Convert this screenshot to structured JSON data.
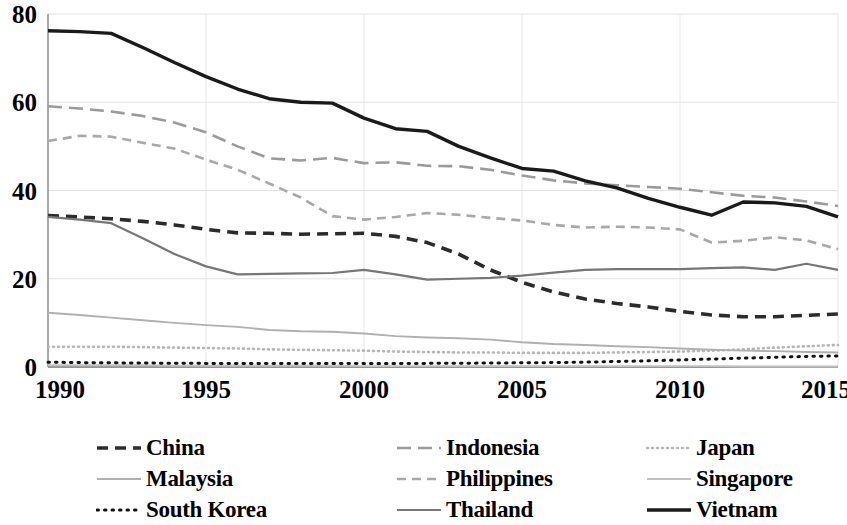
{
  "chart_data": {
    "type": "line",
    "title": "",
    "subtitle": "",
    "xlabel": "",
    "ylabel": "",
    "xlim": [
      1990,
      2015
    ],
    "ylim": [
      0,
      80
    ],
    "grid": true,
    "legend_position": "bottom",
    "y_ticks": [
      "0",
      "20",
      "40",
      "60",
      "80"
    ],
    "y_tick_values": [
      0,
      20,
      40,
      60,
      80
    ],
    "x_ticks": [
      "1990",
      "1995",
      "2000",
      "2005",
      "2010",
      "2015"
    ],
    "x_tick_values": [
      1990,
      1995,
      2000,
      2005,
      2010,
      2015
    ],
    "x": [
      1990,
      1991,
      1992,
      1993,
      1994,
      1995,
      1996,
      1997,
      1998,
      1999,
      2000,
      2001,
      2002,
      2003,
      2004,
      2005,
      2006,
      2007,
      2008,
      2009,
      2010,
      2011,
      2012,
      2013,
      2014,
      2015
    ],
    "series": [
      {
        "name": "China",
        "color": "#2b2b2b",
        "width": 3.6,
        "dash": "11,7",
        "cap": "butt",
        "values": [
          34.3,
          34.0,
          33.6,
          33.0,
          32.2,
          31.2,
          30.4,
          30.3,
          30.1,
          30.2,
          30.3,
          29.6,
          28.2,
          25.6,
          22.0,
          19.2,
          17.0,
          15.4,
          14.4,
          13.6,
          12.6,
          11.8,
          11.4,
          11.4,
          11.7,
          12.0
        ]
      },
      {
        "name": "Indonesia",
        "color": "#9a9a9a",
        "width": 2.6,
        "dash": "14,7",
        "cap": "butt",
        "values": [
          59.1,
          58.6,
          57.9,
          56.9,
          55.4,
          53.2,
          50.0,
          47.3,
          46.8,
          47.4,
          46.2,
          46.4,
          45.6,
          45.5,
          44.7,
          43.4,
          42.3,
          41.6,
          41.2,
          40.8,
          40.4,
          39.6,
          38.8,
          38.4,
          37.5,
          36.5
        ]
      },
      {
        "name": "Japan",
        "color": "#b6b6b6",
        "width": 2.6,
        "dash": "1,4",
        "cap": "round",
        "values": [
          4.6,
          4.6,
          4.6,
          4.5,
          4.4,
          4.3,
          4.2,
          4.0,
          3.9,
          3.8,
          3.7,
          3.5,
          3.4,
          3.3,
          3.3,
          3.2,
          3.2,
          3.2,
          3.3,
          3.4,
          3.5,
          3.7,
          4.0,
          4.4,
          4.7,
          5.0
        ]
      },
      {
        "name": "Malaysia",
        "color": "#b0b0b0",
        "width": 1.9,
        "dash": "none",
        "cap": "butt",
        "values": [
          12.3,
          11.8,
          11.2,
          10.6,
          10.0,
          9.5,
          9.1,
          8.4,
          8.1,
          8.0,
          7.6,
          7.0,
          6.7,
          6.5,
          6.2,
          5.6,
          5.2,
          5.0,
          4.7,
          4.5,
          4.2,
          3.9,
          3.7,
          3.6,
          3.4,
          3.3
        ]
      },
      {
        "name": "Philippines",
        "color": "#a8a8a8",
        "width": 2.6,
        "dash": "9,6",
        "cap": "butt",
        "values": [
          51.2,
          52.4,
          52.2,
          50.8,
          49.5,
          47.0,
          44.7,
          41.6,
          38.4,
          34.2,
          33.4,
          34.0,
          34.9,
          34.5,
          33.8,
          33.2,
          32.2,
          31.6,
          31.8,
          31.6,
          31.2,
          28.2,
          28.6,
          29.4,
          28.7,
          26.7
        ]
      },
      {
        "name": "Singapore",
        "color": "#c0c0c0",
        "width": 1.9,
        "dash": "none",
        "cap": "butt",
        "values": [
          0.4,
          0.4,
          0.4,
          0.4,
          0.3,
          0.3,
          0.3,
          0.3,
          0.3,
          0.3,
          0.2,
          0.2,
          0.2,
          0.2,
          0.2,
          0.2,
          0.2,
          0.2,
          0.2,
          0.2,
          0.2,
          0.2,
          0.1,
          0.1,
          0.1,
          0.1
        ]
      },
      {
        "name": "South Korea",
        "color": "#111111",
        "width": 3.0,
        "dash": "1.5,6",
        "cap": "round",
        "values": [
          1.1,
          1.0,
          0.95,
          0.9,
          0.85,
          0.82,
          0.8,
          0.78,
          0.8,
          0.82,
          0.8,
          0.8,
          0.82,
          0.85,
          0.9,
          0.95,
          1.0,
          1.1,
          1.25,
          1.4,
          1.6,
          1.8,
          2.0,
          2.2,
          2.4,
          2.5
        ]
      },
      {
        "name": "Thailand",
        "color": "#767676",
        "width": 2.2,
        "dash": "none",
        "cap": "butt",
        "values": [
          34.0,
          33.4,
          32.6,
          29.2,
          25.6,
          22.8,
          21.0,
          21.1,
          21.2,
          21.3,
          22.0,
          21.0,
          19.8,
          20.0,
          20.2,
          20.7,
          21.4,
          22.0,
          22.2,
          22.2,
          22.2,
          22.4,
          22.6,
          22.0,
          23.4,
          22.0
        ]
      },
      {
        "name": "Vietnam",
        "color": "#1a1a1a",
        "width": 3.4,
        "dash": "none",
        "cap": "butt",
        "values": [
          76.2,
          76.0,
          75.6,
          72.4,
          69.0,
          65.8,
          63.0,
          60.8,
          60.0,
          59.8,
          56.4,
          54.0,
          53.4,
          50.0,
          47.4,
          45.0,
          44.4,
          42.2,
          40.6,
          38.2,
          36.2,
          34.4,
          37.4,
          37.2,
          36.4,
          34.0
        ]
      }
    ]
  },
  "legend": {
    "items": [
      {
        "label": "China",
        "key": "China"
      },
      {
        "label": "Indonesia",
        "key": "Indonesia"
      },
      {
        "label": "Japan",
        "key": "Japan"
      },
      {
        "label": "Malaysia",
        "key": "Malaysia"
      },
      {
        "label": "Philippines",
        "key": "Philippines"
      },
      {
        "label": "Singapore",
        "key": "Singapore"
      },
      {
        "label": "South Korea",
        "key": "South Korea"
      },
      {
        "label": "Thailand",
        "key": "Thailand"
      },
      {
        "label": "Vietnam",
        "key": "Vietnam"
      }
    ]
  }
}
